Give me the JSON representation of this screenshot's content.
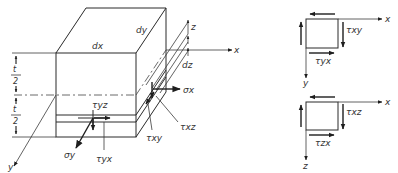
{
  "figure": {
    "colors": {
      "ink": "#2a2a2a",
      "background": "#ffffff"
    }
  },
  "main_element": {
    "labels": {
      "dx": "dx",
      "dy": "dy",
      "dz": "dz",
      "axis_x": "x",
      "axis_y": "y",
      "axis_z": "z",
      "half_thickness_top": "t",
      "half_thickness_top_den": "2",
      "half_thickness_bottom": "t",
      "half_thickness_bottom_den": "2"
    },
    "stresses": {
      "sigma_x": "σx",
      "sigma_y": "σy",
      "tau_yz": "τyz",
      "tau_yx": "τyx",
      "tau_xy": "τxy",
      "tau_xz": "τxz"
    }
  },
  "inset_xy": {
    "axis_h": "x",
    "axis_v": "y",
    "tau_side": "τxy",
    "tau_bottom": "τyx"
  },
  "inset_xz": {
    "axis_h": "x",
    "axis_v": "z",
    "tau_side": "τxz",
    "tau_bottom": "τzx"
  }
}
